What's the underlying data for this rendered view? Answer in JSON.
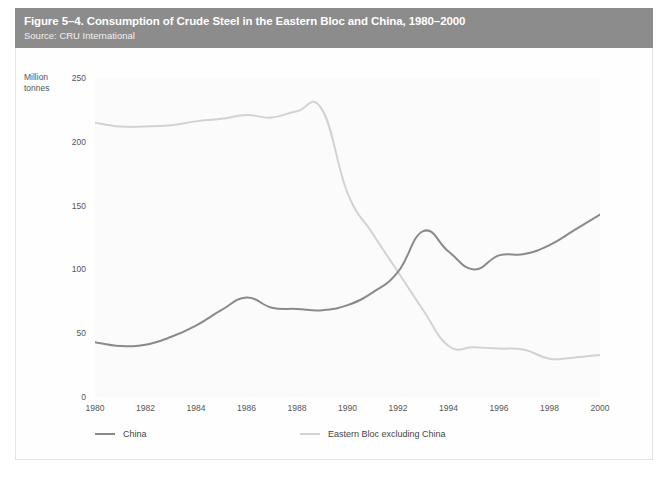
{
  "figure": {
    "title": "Figure 5–4. Consumption of Crude Steel in the Eastern Bloc and China, 1980–2000",
    "source": "Source: CRU International",
    "band_color": "#8c8c8c"
  },
  "chart_data": {
    "type": "line",
    "title": "Figure 5–4. Consumption of Crude Steel in the Eastern Bloc and China, 1980–2000",
    "subtitle": "Source: CRU International",
    "xlabel": "",
    "ylabel": "Million tonnes",
    "ylabel_line1": "Million",
    "ylabel_line2": "tonnes",
    "grid": false,
    "legend_position": "bottom-left",
    "xlim": [
      1980,
      2000
    ],
    "ylim": [
      0,
      250
    ],
    "yticks": [
      0,
      50,
      100,
      150,
      200,
      250
    ],
    "ytick_labels": [
      "0",
      "50",
      "100",
      "150",
      "200",
      "250"
    ],
    "xticks": [
      1980,
      1982,
      1984,
      1986,
      1988,
      1990,
      1992,
      1994,
      1996,
      1998,
      2000
    ],
    "xtick_labels": [
      "1980",
      "1982",
      "1984",
      "1986",
      "1988",
      "1990",
      "1992",
      "1994",
      "1996",
      "1998",
      "2000"
    ],
    "x": [
      1980,
      1981,
      1982,
      1983,
      1984,
      1985,
      1986,
      1987,
      1988,
      1989,
      1990,
      1991,
      1992,
      1993,
      1994,
      1995,
      1996,
      1997,
      1998,
      1999,
      2000
    ],
    "series": [
      {
        "name": "China",
        "color": "#8a8a8a",
        "values": [
          43,
          40,
          41,
          47,
          56,
          68,
          78,
          70,
          69,
          68,
          72,
          82,
          98,
          130,
          114,
          100,
          111,
          112,
          119,
          131,
          143
        ]
      },
      {
        "name": "Eastern Bloc excluding China",
        "color": "#d2d2d2",
        "values": [
          215,
          212,
          212,
          213,
          216,
          218,
          221,
          219,
          224,
          225,
          160,
          128,
          98,
          68,
          40,
          39,
          38,
          37,
          30,
          31,
          33
        ]
      }
    ],
    "legend": [
      {
        "label": "China",
        "color": "#8a8a8a"
      },
      {
        "label": "Eastern Bloc excluding China",
        "color": "#d2d2d2"
      }
    ]
  }
}
